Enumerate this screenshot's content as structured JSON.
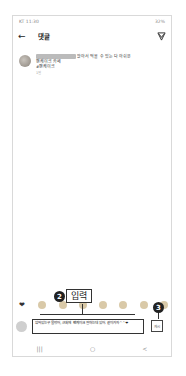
{
  "status_bar": {
    "carrier_time": "KT 11:30",
    "battery": "32%"
  },
  "header": {
    "back_icon": "arrow-left-icon",
    "title": "댓글",
    "send_icon": "paper-plane-icon"
  },
  "comment": {
    "username": "username_hidden",
    "line1": "앉아서 먹을 수 있는 다 아쉬운",
    "line2": "팬케이크 카페",
    "hashtag": "#팬케이크",
    "time": "1일"
  },
  "emoji_row": [
    "❤",
    "🙌",
    "🔥",
    "👏",
    "😢",
    "😍",
    "😮",
    "😂"
  ],
  "input": {
    "value": "앉아있는곳 물었어, 근처에 팬케이크 잘하는데 있어. 같이가자^^❤",
    "post_label": "게시"
  },
  "navbar": {
    "recent": "|||",
    "home": "○",
    "back": "<"
  },
  "annotations": {
    "step2_number": "2",
    "step2_label": "입력",
    "step3_number": "3"
  }
}
